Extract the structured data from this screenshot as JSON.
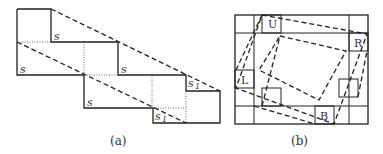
{
  "panel_a": {
    "caption": "(a)",
    "labels": [
      {
        "text": "s",
        "sub": "",
        "x": 54,
        "y": 40
      },
      {
        "text": "s",
        "sub": "",
        "x": 20,
        "y": 73
      },
      {
        "text": "s",
        "sub": "",
        "x": 121,
        "y": 73
      },
      {
        "text": "s",
        "sub": "",
        "x": 87,
        "y": 106
      },
      {
        "text": "s",
        "sub": "1",
        "x": 188,
        "y": 87
      },
      {
        "text": "s",
        "sub": "1",
        "x": 155,
        "y": 120
      }
    ]
  },
  "panel_b": {
    "caption": "(b)",
    "labels": [
      {
        "text": "U",
        "x": 272,
        "y": 28
      },
      {
        "text": "R",
        "x": 355,
        "y": 47
      },
      {
        "text": "L",
        "x": 243,
        "y": 84
      },
      {
        "text": "B",
        "x": 321,
        "y": 120
      }
    ]
  }
}
